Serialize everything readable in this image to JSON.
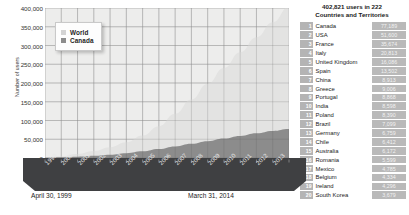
{
  "chart_data": {
    "type": "area",
    "title": "",
    "xlabel": "",
    "ylabel": "Number of users",
    "stacked": true,
    "grid": true,
    "legend_position": "top-left",
    "ylim": [
      0,
      400000
    ],
    "ytick_values": [
      0,
      50000,
      100000,
      150000,
      200000,
      250000,
      300000,
      350000,
      400000
    ],
    "ytick_labels": [
      "0",
      "50,000",
      "100,000",
      "150,000",
      "200,000",
      "250,000",
      "300,000",
      "350,000",
      "400,000"
    ],
    "categories": [
      "1999",
      "2000",
      "2001",
      "2002",
      "2003",
      "2004",
      "2005",
      "2006",
      "2007",
      "2008",
      "2009",
      "2010",
      "2011",
      "2012",
      "2013",
      "2014"
    ],
    "series": [
      {
        "name": "World",
        "color": "#e3e3e2",
        "values": [
          1500,
          5000,
          11000,
          19000,
          29000,
          42000,
          60000,
          85000,
          118000,
          156000,
          198000,
          240000,
          282000,
          322000,
          362000,
          402821
        ]
      },
      {
        "name": "Canada",
        "color": "#8c8c8c",
        "values": [
          600,
          1800,
          3600,
          6000,
          9000,
          13000,
          18000,
          24000,
          31000,
          38000,
          45000,
          52000,
          59000,
          66000,
          72000,
          77189
        ]
      }
    ],
    "annotations": {
      "start_date": "April 30, 1999",
      "end_date": "March 31, 2014"
    }
  },
  "legend": {
    "items": [
      {
        "label": "World",
        "color": "#d3d3d3"
      },
      {
        "label": "Canada",
        "color": "#8c8c8c"
      }
    ]
  },
  "axis": {
    "ylabel": "Number of users",
    "yticks": [
      "400,000",
      "350,000",
      "300,000",
      "250,000",
      "200,000",
      "150,000",
      "100,000",
      "50,000",
      "0"
    ],
    "xticks": [
      "1999",
      "2000",
      "2001",
      "2002",
      "2003",
      "2004",
      "2005",
      "2006",
      "2007",
      "2008",
      "2009",
      "2010",
      "2011",
      "2012",
      "2013"
    ]
  },
  "captions": {
    "start": "April 30, 1999",
    "end": "March 31, 2014"
  },
  "panel": {
    "title_line1": "402,821 users in 222",
    "title_line2": "Countries and Territories",
    "rows": [
      {
        "rank": "1",
        "country": "Canada",
        "value": "77,189"
      },
      {
        "rank": "2",
        "country": "USA",
        "value": "51,600"
      },
      {
        "rank": "3",
        "country": "France",
        "value": "35,674"
      },
      {
        "rank": "4",
        "country": "Italy",
        "value": "20,813"
      },
      {
        "rank": "5",
        "country": "United Kingdom",
        "value": "16,086"
      },
      {
        "rank": "6",
        "country": "Spain",
        "value": "13,502"
      },
      {
        "rank": "7",
        "country": "China",
        "value": "8,913"
      },
      {
        "rank": "8",
        "country": "Greece",
        "value": "9,006"
      },
      {
        "rank": "9",
        "country": "Portugal",
        "value": "8,868"
      },
      {
        "rank": "10",
        "country": "India",
        "value": "8,598"
      },
      {
        "rank": "11",
        "country": "Poland",
        "value": "8,390"
      },
      {
        "rank": "12",
        "country": "Brazil",
        "value": "7,099"
      },
      {
        "rank": "13",
        "country": "Germany",
        "value": "6,759"
      },
      {
        "rank": "14",
        "country": "Chile",
        "value": "6,412"
      },
      {
        "rank": "15",
        "country": "Australia",
        "value": "6,172"
      },
      {
        "rank": "16",
        "country": "Romania",
        "value": "5,599"
      },
      {
        "rank": "17",
        "country": "Mexico",
        "value": "4,785"
      },
      {
        "rank": "18",
        "country": "Belgium",
        "value": "4,334"
      },
      {
        "rank": "19",
        "country": "Ireland",
        "value": "4,296"
      },
      {
        "rank": "20",
        "country": "South Korea",
        "value": "3,679"
      }
    ]
  }
}
